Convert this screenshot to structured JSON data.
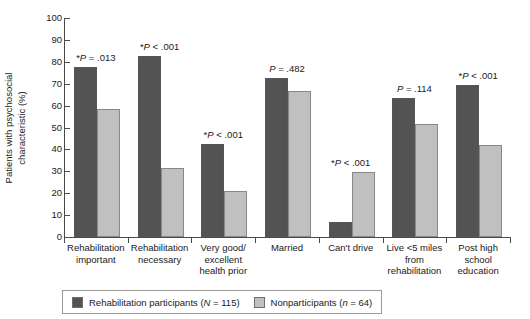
{
  "chart_data": {
    "type": "bar",
    "title": "",
    "xlabel": "",
    "ylabel_line1": "Patients with psychosocial",
    "ylabel_line2": "characteristic (%)",
    "ylim": [
      0,
      100
    ],
    "yticks": [
      0,
      10,
      20,
      30,
      40,
      50,
      60,
      70,
      80,
      90,
      100
    ],
    "grid": false,
    "legend_position": "bottom",
    "categories": [
      "Rehabilitation important",
      "Rehabilitation necessary",
      "Very good/ excellent health prior",
      "Married",
      "Can't drive",
      "Live <5 miles from rehabilitation",
      "Post high school education"
    ],
    "category_lines": [
      [
        "Rehabilitation",
        "important"
      ],
      [
        "Rehabilitation",
        "necessary"
      ],
      [
        "Very good/",
        "excellent",
        "health prior"
      ],
      [
        "Married"
      ],
      [
        "Can't drive"
      ],
      [
        "Live <5 miles",
        "from",
        "rehabilitation"
      ],
      [
        "Post high",
        "school",
        "education"
      ]
    ],
    "series": [
      {
        "name": "Rehabilitation participants (N = 115)",
        "color": "#535353",
        "values": [
          77.5,
          82.5,
          42.5,
          72.5,
          7.0,
          63.5,
          69.5
        ]
      },
      {
        "name": "Nonparticipants (n = 64)",
        "color": "#c0c0c0",
        "values": [
          58.5,
          31.5,
          21.0,
          66.5,
          29.5,
          51.5,
          42.0
        ]
      }
    ],
    "annotations": [
      {
        "star": "*",
        "stat": "P",
        "rest": " = .013",
        "group": 0
      },
      {
        "star": "*",
        "stat": "P",
        "rest": " < .001",
        "group": 1
      },
      {
        "star": "*",
        "stat": "P",
        "rest": " < .001",
        "group": 2
      },
      {
        "star": "",
        "stat": "P",
        "rest": " = .482",
        "group": 3
      },
      {
        "star": "*",
        "stat": "P",
        "rest": " < .001",
        "group": 4
      },
      {
        "star": "",
        "stat": "P",
        "rest": " = .114",
        "group": 5
      },
      {
        "star": "*",
        "stat": "P",
        "rest": " < .001",
        "group": 6
      }
    ]
  },
  "ytick_labels": [
    "100",
    "90",
    "80",
    "70",
    "60",
    "50",
    "40",
    "30",
    "20",
    "10",
    "0"
  ],
  "legend": {
    "entries": [
      {
        "label_pre": "Rehabilitation participants (",
        "label_italic": "N",
        "label_post": " = 115)",
        "swatch": "dark"
      },
      {
        "label_pre": "Nonparticipants (",
        "label_italic": "n",
        "label_post": " = 64)",
        "swatch": "light"
      }
    ]
  },
  "pvalue_text": [
    "*P = .013",
    "*P < .001",
    "*P < .001",
    "P = .482",
    "*P < .001",
    "P = .114",
    "*P < .001"
  ]
}
